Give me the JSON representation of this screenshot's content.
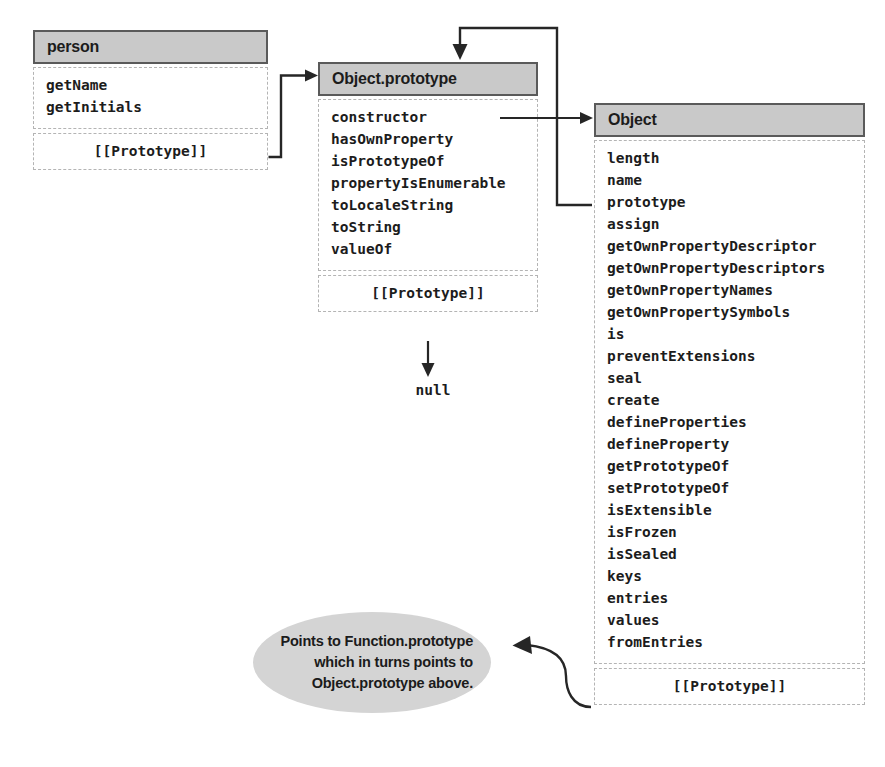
{
  "diagram": {
    "colors": {
      "header_fill": "#c9c9c9",
      "header_border": "#5a5a5a",
      "section_border": "#b4b4b4",
      "callout_fill": "#d4d4d4",
      "wire": "#262626",
      "text": "#1c1c1c",
      "background": "#ffffff"
    }
  },
  "boxes": {
    "person": {
      "header": "person",
      "props": [
        "getName",
        "getInitials"
      ],
      "prototype_label": "[[Prototype]]"
    },
    "object_prototype": {
      "header": "Object.prototype",
      "props": [
        "constructor",
        "hasOwnProperty",
        "isPrototypeOf",
        "propertyIsEnumerable",
        "toLocaleString",
        "toString",
        "valueOf"
      ],
      "prototype_label": "[[Prototype]]"
    },
    "object": {
      "header": "Object",
      "props": [
        "length",
        "name",
        "prototype",
        "assign",
        "getOwnPropertyDescriptor",
        "getOwnPropertyDescriptors",
        "getOwnPropertyNames",
        "getOwnPropertySymbols",
        "is",
        "preventExtensions",
        "seal",
        "create",
        "defineProperties",
        "defineProperty",
        "getPrototypeOf",
        "setPrototypeOf",
        "isExtensible",
        "isFrozen",
        "isSealed",
        "keys",
        "entries",
        "values",
        "fromEntries"
      ],
      "prototype_label": "[[Prototype]]"
    }
  },
  "labels": {
    "null_terminator": "null"
  },
  "callout": {
    "lines": [
      "Points to Function.prototype",
      "which in turns points to",
      "Object.prototype above."
    ],
    "text": "Points to Function.prototype which in turns points to Object.prototype above."
  },
  "connectors": [
    {
      "name": "person-prototype-to-object-prototype",
      "from": "person.[[Prototype]]",
      "to": "Object.prototype header"
    },
    {
      "name": "object-prototype-constructor-to-object",
      "from": "Object.prototype.constructor",
      "to": "Object header"
    },
    {
      "name": "object-prototype-row-back-to-object-prototype",
      "from": "Object.prototype (row in Object)",
      "to": "Object.prototype header"
    },
    {
      "name": "object-prototype-prototype-to-null",
      "from": "Object.prototype.[[Prototype]]",
      "to": "null"
    },
    {
      "name": "object-prototype-slot-to-callout",
      "from": "Object.[[Prototype]]",
      "to": "callout bubble"
    }
  ]
}
